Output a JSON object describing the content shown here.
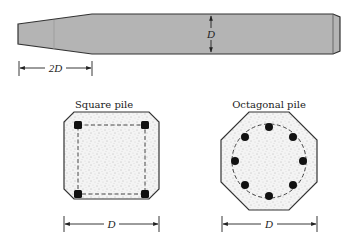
{
  "elevation": {
    "depth_label": "D",
    "taper_label": "2D",
    "fill_color": "#b4b4b4",
    "outline_color": "#333333"
  },
  "square_pile": {
    "title": "Square pile",
    "dimension_label": "D",
    "bar_count": 4
  },
  "octagonal_pile": {
    "title": "Octagonal pile",
    "dimension_label": "D",
    "bar_count": 8
  }
}
